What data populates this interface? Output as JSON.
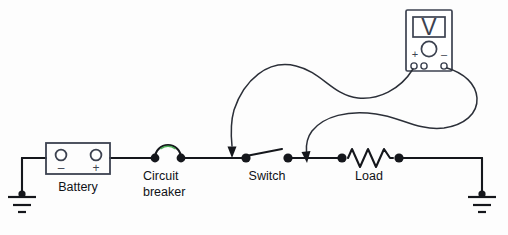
{
  "diagram": {
    "background_color": "#fdfdfd",
    "wire_color": "#15171c",
    "instrument_color": "#3c4250",
    "highlight_color": "#4fae5a"
  },
  "components": {
    "battery": {
      "label": "Battery",
      "negative_sign": "–",
      "positive_sign": "+"
    },
    "circuit_breaker": {
      "label_line1": "Circuit",
      "label_line2": "breaker"
    },
    "switch": {
      "label": "Switch",
      "state": "open"
    },
    "load": {
      "label": "Load",
      "symbol": "resistor-zigzag"
    },
    "ground_left": {
      "label": ""
    },
    "ground_right": {
      "label": ""
    },
    "meter": {
      "display_value": "V",
      "dial_label": "",
      "positive_sign": "+",
      "negative_sign": "–",
      "jacks": 3
    }
  },
  "leads": {
    "positive_lead": {
      "from": "meter-positive-jack",
      "to": "node-left-of-switch",
      "arrow": true
    },
    "negative_lead": {
      "from": "meter-negative-jack",
      "to": "node-right-of-switch",
      "arrow": true
    }
  }
}
